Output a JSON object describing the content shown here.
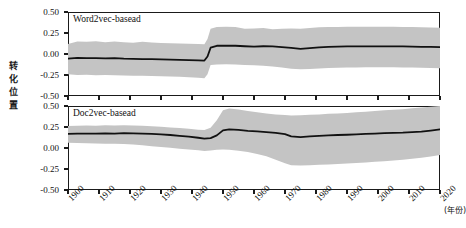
{
  "chart_data": {
    "type": "line",
    "title": "",
    "xlabel": "(年份)",
    "ylabel": "转化位置",
    "xlim": [
      1900,
      2020
    ],
    "ylim": [
      -0.5,
      0.5
    ],
    "grid": false,
    "legend": "none",
    "x_ticks": [
      1900,
      1910,
      1920,
      1930,
      1940,
      1950,
      1960,
      1970,
      1980,
      1990,
      2000,
      2010,
      2020
    ],
    "x_tick_labels": [
      "1900",
      "1910",
      "1920",
      "1930",
      "1940",
      "1950",
      "1960",
      "1970",
      "1980",
      "1990",
      "2000",
      "2010",
      "2020"
    ],
    "y_ticks": [
      0.5,
      0.25,
      0.0,
      -0.25,
      -0.5
    ],
    "y_tick_labels": [
      "0.50",
      "0.25",
      "0.00",
      "-0.25",
      "-0.50"
    ],
    "band_color": "#c4c4c4",
    "line_color": "#111111",
    "panels": [
      {
        "name": "Word2vec-basead",
        "label": "Word2vec-basead",
        "x": [
          1900,
          1903,
          1906,
          1909,
          1912,
          1915,
          1918,
          1921,
          1924,
          1927,
          1930,
          1933,
          1936,
          1939,
          1942,
          1944,
          1945,
          1946,
          1948,
          1951,
          1954,
          1957,
          1960,
          1963,
          1966,
          1969,
          1972,
          1975,
          1978,
          1981,
          1984,
          1987,
          1990,
          1993,
          1996,
          1999,
          2002,
          2005,
          2008,
          2011,
          2014,
          2017,
          2020
        ],
        "mean": [
          -0.055,
          -0.045,
          -0.05,
          -0.048,
          -0.052,
          -0.048,
          -0.055,
          -0.058,
          -0.06,
          -0.062,
          -0.065,
          -0.068,
          -0.07,
          -0.072,
          -0.075,
          -0.078,
          -0.03,
          0.075,
          0.098,
          0.1,
          0.098,
          0.092,
          0.088,
          0.092,
          0.09,
          0.082,
          0.072,
          0.062,
          0.07,
          0.08,
          0.086,
          0.088,
          0.09,
          0.09,
          0.09,
          0.09,
          0.09,
          0.09,
          0.09,
          0.088,
          0.086,
          0.084,
          0.082
        ],
        "upper": [
          0.12,
          0.15,
          0.145,
          0.152,
          0.14,
          0.15,
          0.14,
          0.135,
          0.145,
          0.138,
          0.13,
          0.128,
          0.125,
          0.122,
          0.118,
          0.115,
          0.18,
          0.3,
          0.32,
          0.325,
          0.32,
          0.3,
          0.305,
          0.31,
          0.295,
          0.3,
          0.305,
          0.3,
          0.31,
          0.318,
          0.32,
          0.322,
          0.325,
          0.325,
          0.325,
          0.325,
          0.325,
          0.325,
          0.322,
          0.32,
          0.318,
          0.315,
          0.312
        ],
        "lower": [
          -0.24,
          -0.25,
          -0.248,
          -0.252,
          -0.25,
          -0.252,
          -0.255,
          -0.258,
          -0.26,
          -0.262,
          -0.265,
          -0.268,
          -0.272,
          -0.278,
          -0.282,
          -0.288,
          -0.24,
          -0.13,
          -0.125,
          -0.122,
          -0.125,
          -0.13,
          -0.135,
          -0.14,
          -0.148,
          -0.16,
          -0.175,
          -0.182,
          -0.178,
          -0.172,
          -0.168,
          -0.165,
          -0.162,
          -0.16,
          -0.158,
          -0.158,
          -0.158,
          -0.158,
          -0.16,
          -0.162,
          -0.165,
          -0.168,
          -0.17
        ]
      },
      {
        "name": "Doc2vec-basead",
        "label": "Doc2vec-basead",
        "x": [
          1900,
          1903,
          1906,
          1909,
          1912,
          1915,
          1918,
          1921,
          1924,
          1927,
          1930,
          1933,
          1936,
          1939,
          1942,
          1944,
          1946,
          1948,
          1950,
          1952,
          1955,
          1958,
          1961,
          1964,
          1967,
          1970,
          1972,
          1975,
          1978,
          1981,
          1984,
          1987,
          1990,
          1993,
          1996,
          1999,
          2002,
          2005,
          2008,
          2011,
          2014,
          2017,
          2020
        ],
        "mean": [
          0.168,
          0.17,
          0.172,
          0.17,
          0.174,
          0.172,
          0.176,
          0.174,
          0.172,
          0.168,
          0.162,
          0.155,
          0.145,
          0.135,
          0.122,
          0.112,
          0.118,
          0.15,
          0.21,
          0.222,
          0.215,
          0.205,
          0.198,
          0.19,
          0.18,
          0.165,
          0.138,
          0.13,
          0.138,
          0.145,
          0.15,
          0.155,
          0.158,
          0.162,
          0.168,
          0.172,
          0.178,
          0.18,
          0.182,
          0.188,
          0.196,
          0.208,
          0.222
        ],
        "upper": [
          0.262,
          0.265,
          0.268,
          0.265,
          0.27,
          0.268,
          0.272,
          0.268,
          0.265,
          0.258,
          0.252,
          0.245,
          0.238,
          0.228,
          0.218,
          0.215,
          0.24,
          0.33,
          0.45,
          0.47,
          0.458,
          0.44,
          0.425,
          0.412,
          0.4,
          0.392,
          0.388,
          0.39,
          0.395,
          0.4,
          0.408,
          0.412,
          0.418,
          0.425,
          0.432,
          0.44,
          0.448,
          0.455,
          0.462,
          0.472,
          0.482,
          0.492,
          0.5
        ],
        "lower": [
          0.062,
          0.06,
          0.058,
          0.055,
          0.052,
          0.05,
          0.048,
          0.042,
          0.032,
          0.022,
          0.012,
          0.002,
          -0.008,
          -0.018,
          -0.028,
          -0.035,
          -0.03,
          -0.02,
          -0.018,
          -0.022,
          -0.032,
          -0.048,
          -0.07,
          -0.098,
          -0.14,
          -0.182,
          -0.205,
          -0.208,
          -0.205,
          -0.2,
          -0.195,
          -0.19,
          -0.185,
          -0.18,
          -0.172,
          -0.165,
          -0.158,
          -0.15,
          -0.14,
          -0.128,
          -0.115,
          -0.1,
          -0.082
        ]
      }
    ]
  }
}
